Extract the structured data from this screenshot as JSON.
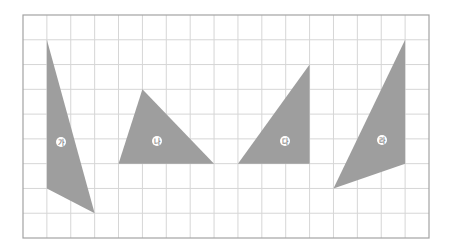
{
  "grid": {
    "origin_x": 23,
    "origin_y": 15,
    "columns": 17,
    "rows": 9,
    "width": 406,
    "height": 223,
    "line_color": "#d6d6d6",
    "border_color": "#a3a3a3"
  },
  "shape_fill": "#9e9e9e",
  "label_circle_fill": "#ffffff",
  "shapes": [
    {
      "id": "ga",
      "label": "가",
      "vertices": [
        [
          1,
          1
        ],
        [
          1,
          7
        ],
        [
          3,
          8
        ]
      ],
      "label_pos": [
        61,
        142
      ]
    },
    {
      "id": "na",
      "label": "나",
      "vertices": [
        [
          5,
          3
        ],
        [
          4,
          6
        ],
        [
          8,
          6
        ]
      ],
      "label_pos": [
        157,
        141
      ]
    },
    {
      "id": "da",
      "label": "다",
      "vertices": [
        [
          12,
          2
        ],
        [
          9,
          6
        ],
        [
          12,
          6
        ]
      ],
      "label_pos": [
        285,
        141
      ]
    },
    {
      "id": "ra",
      "label": "라",
      "vertices": [
        [
          16,
          1
        ],
        [
          16,
          6
        ],
        [
          13,
          7
        ]
      ],
      "label_pos": [
        382,
        140
      ]
    }
  ]
}
